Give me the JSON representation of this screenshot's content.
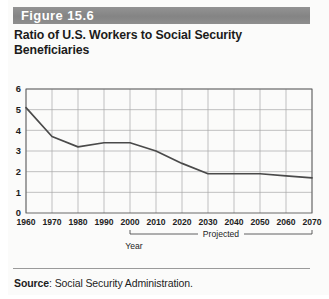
{
  "figure": {
    "header_label": "Figure 15.6",
    "title_line1": "Ratio of U.S. Workers to Social Security",
    "title_line2": "Beneficiaries",
    "source_prefix": "Source",
    "source_text": ": Social Security Administration.",
    "header_color": "#8d8d8d",
    "line_color": "#4a4a4a",
    "grid_color": "#a8a8a8"
  },
  "chart_data": {
    "type": "line",
    "title": "Ratio of U.S. Workers to Social Security Beneficiaries",
    "xlabel": "Year",
    "ylabel": "",
    "x": [
      1960,
      1970,
      1980,
      1990,
      2000,
      2010,
      2020,
      2030,
      2040,
      2050,
      2060,
      2070
    ],
    "values": [
      5.1,
      3.7,
      3.2,
      3.4,
      3.4,
      3.0,
      2.4,
      1.9,
      1.9,
      1.9,
      1.8,
      1.7
    ],
    "xticklabels": [
      "1960",
      "1970",
      "1980",
      "1990",
      "2000",
      "2010",
      "2020",
      "2030",
      "2040",
      "2050",
      "2060",
      "2070"
    ],
    "yticklabels": [
      "0",
      "1",
      "2",
      "3",
      "4",
      "5",
      "6"
    ],
    "yticks": [
      0,
      1,
      2,
      3,
      4,
      5,
      6
    ],
    "xlim": [
      1960,
      2070
    ],
    "ylim": [
      0,
      6
    ],
    "grid": true,
    "legend": false,
    "annotations": [
      {
        "text": "Projected",
        "from_x": 2000,
        "to_x": 2070
      }
    ]
  },
  "axis": {
    "y_labels": [
      "6",
      "5",
      "4",
      "3",
      "2",
      "1",
      "0"
    ],
    "x_labels": [
      "1960",
      "1970",
      "1980",
      "1990",
      "2000",
      "2010",
      "2020",
      "2030",
      "2040",
      "2050",
      "2060",
      "2070"
    ],
    "year_label": "Year",
    "projected_label": "Projected"
  }
}
